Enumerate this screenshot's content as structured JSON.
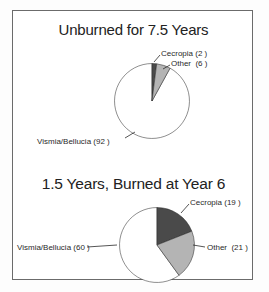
{
  "figure": {
    "background_color": "#ffffff",
    "frame_color": "#6b6b6b"
  },
  "charts": [
    {
      "id": "unburned",
      "title": "Unburned for 7.5 Years",
      "labels": {
        "cecropia": "Cecropia (2 )",
        "other": "Other  (6 )",
        "vismia": "Vismia/Bellucia (92 )"
      }
    },
    {
      "id": "burned",
      "title": "1.5 Years, Burned at Year 6",
      "labels": {
        "cecropia": "Cecropia (19 )",
        "other": "Other  (21 )",
        "vismia": "Vismia/Bellucia (60 )"
      }
    }
  ],
  "chart_data": [
    {
      "type": "pie",
      "title": "Unburned for 7.5 Years",
      "categories": [
        "Cecropia",
        "Other",
        "Vismia/Bellucia"
      ],
      "values": [
        2,
        6,
        92
      ],
      "total": 100,
      "colors": [
        "#4a4a4a",
        "#b4b4b4",
        "#ffffff"
      ],
      "start_angle_deg": 0,
      "direction": "clockwise",
      "legend": "labels-outside",
      "annotations": [
        "Cecropia (2 )",
        "Other  (6 )",
        "Vismia/Bellucia (92 )"
      ]
    },
    {
      "type": "pie",
      "title": "1.5 Years, Burned at Year 6",
      "categories": [
        "Cecropia",
        "Other",
        "Vismia/Bellucia"
      ],
      "values": [
        19,
        21,
        60
      ],
      "total": 100,
      "colors": [
        "#4a4a4a",
        "#b4b4b4",
        "#ffffff"
      ],
      "start_angle_deg": 0,
      "direction": "clockwise",
      "legend": "labels-outside",
      "annotations": [
        "Cecropia (19 )",
        "Other  (21 )",
        "Vismia/Bellucia (60 )"
      ]
    }
  ]
}
